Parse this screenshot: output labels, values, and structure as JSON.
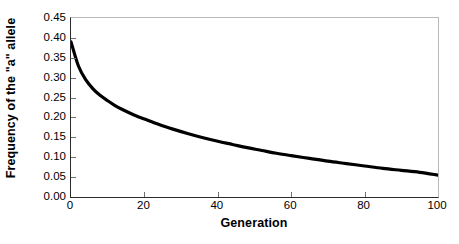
{
  "chart_data": {
    "type": "line",
    "title": "",
    "subtitle": "",
    "xlabel": "Generation",
    "ylabel": "Frequency of the \"a\" allele",
    "xlim": [
      0,
      100
    ],
    "ylim": [
      0.0,
      0.45
    ],
    "xticks": [
      0,
      20,
      40,
      60,
      80,
      100
    ],
    "xtick_labels": [
      "0",
      "20",
      "40",
      "60",
      "80",
      "100"
    ],
    "yticks": [
      0.0,
      0.05,
      0.1,
      0.15,
      0.2,
      0.25,
      0.3,
      0.35,
      0.4,
      0.45
    ],
    "ytick_labels": [
      "0.00",
      "0.05",
      "0.10",
      "0.15",
      "0.20",
      "0.25",
      "0.30",
      "0.35",
      "0.40",
      "0.45"
    ],
    "grid": false,
    "legend": null,
    "annotations": [],
    "series": [
      {
        "name": "Frequency of the \"a\" allele",
        "color": "#000000",
        "line_width": 3.2,
        "x": [
          0,
          2,
          4,
          6,
          8,
          10,
          12,
          14,
          16,
          18,
          20,
          24,
          28,
          32,
          36,
          40,
          44,
          48,
          52,
          56,
          60,
          65,
          70,
          75,
          80,
          85,
          90,
          95,
          100
        ],
        "y": [
          0.39,
          0.33,
          0.295,
          0.272,
          0.255,
          0.242,
          0.23,
          0.22,
          0.211,
          0.203,
          0.196,
          0.182,
          0.17,
          0.159,
          0.149,
          0.14,
          0.132,
          0.124,
          0.117,
          0.11,
          0.104,
          0.097,
          0.09,
          0.084,
          0.078,
          0.072,
          0.067,
          0.062,
          0.055
        ]
      }
    ]
  },
  "axes": {
    "frame_color": "#b9b9b9",
    "spine_color": "#2a2a2a",
    "tick_color": "#6f6f6f",
    "background": "#ffffff"
  }
}
